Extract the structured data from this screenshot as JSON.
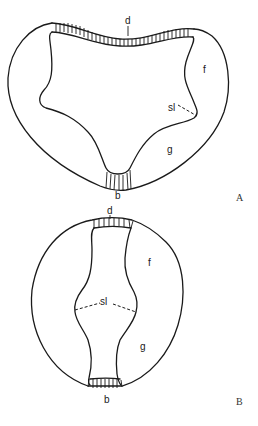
{
  "figure": {
    "panels": [
      {
        "id": "A",
        "panel_label": "A",
        "labels": {
          "dorsal": "d",
          "frontal_lobe": "f",
          "suture_line": "sl",
          "germinal": "g",
          "basal": "b"
        }
      },
      {
        "id": "B",
        "panel_label": "B",
        "labels": {
          "dorsal": "d",
          "frontal_lobe": "f",
          "suture_line": "sl",
          "germinal": "g",
          "basal": "b"
        }
      }
    ],
    "colors": {
      "stroke": "#1a1a1a",
      "background": "#ffffff"
    }
  }
}
